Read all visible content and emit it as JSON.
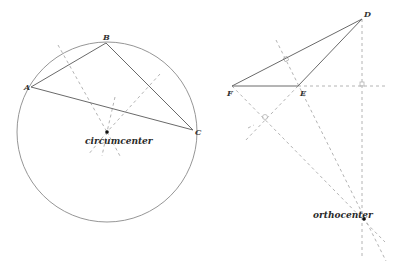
{
  "diagram": {
    "left": {
      "title": "circumcenter construction",
      "vertices": [
        {
          "label": "A",
          "x": 31,
          "y": 87
        },
        {
          "label": "B",
          "x": 106,
          "y": 43
        },
        {
          "label": "C",
          "x": 193,
          "y": 130
        }
      ],
      "center_label": "circumcenter",
      "center": {
        "x": 107,
        "y": 132
      },
      "radius": 90
    },
    "right": {
      "title": "orthocenter construction",
      "vertices": [
        {
          "label": "D",
          "x": 362,
          "y": 19
        },
        {
          "label": "E",
          "x": 298,
          "y": 86
        },
        {
          "label": "F",
          "x": 232,
          "y": 86
        }
      ],
      "center_label": "orthocenter",
      "center": {
        "x": 364,
        "y": 219
      }
    },
    "colors": {
      "solid_line": "#6a6a6a",
      "dashed_line": "#b4b4b4",
      "text": "#2a2a2a"
    }
  }
}
